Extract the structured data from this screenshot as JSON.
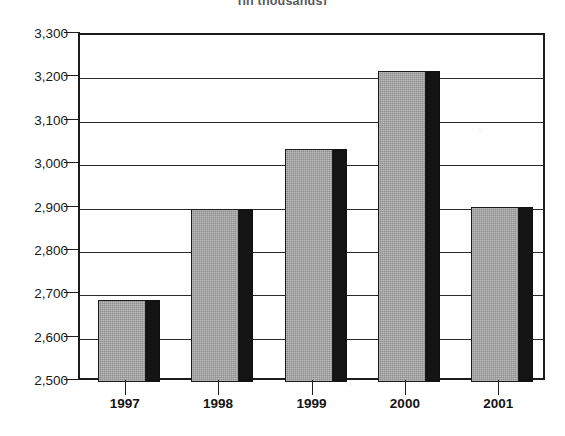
{
  "title_strip": {
    "text": "(in thousands)",
    "note": "cropped at top edge"
  },
  "chart_data": {
    "type": "bar",
    "title": "",
    "subtitle": "(in thousands)",
    "categories": [
      "1997",
      "1998",
      "1999",
      "2000",
      "2001"
    ],
    "values": [
      2688,
      2898,
      3037,
      3216,
      2903
    ],
    "series": [
      {
        "name": "value",
        "values": [
          2688,
          2898,
          3037,
          3216,
          2903
        ]
      }
    ],
    "xlabel": "",
    "ylabel": "",
    "ylim": [
      2500,
      3300
    ],
    "ytick_step": 100,
    "yticks": [
      3300,
      3200,
      3100,
      3000,
      2900,
      2800,
      2700,
      2600,
      2500
    ],
    "ytick_labels": [
      "3,300",
      "3,200",
      "3,100",
      "3,000",
      "2,900",
      "2,800",
      "2,700",
      "2,600",
      "2,500"
    ],
    "grid": true,
    "grid_axis": "y",
    "legend": false,
    "legend_position": "none",
    "bar_style": "3d-shadow",
    "colors": {
      "bar_face": "#8e8e8e",
      "bar_side": "#141414",
      "axis": "#1c1c1c",
      "grid": "#2a2a2a",
      "background": "#ffffff",
      "text": "#1a1a1a"
    }
  }
}
